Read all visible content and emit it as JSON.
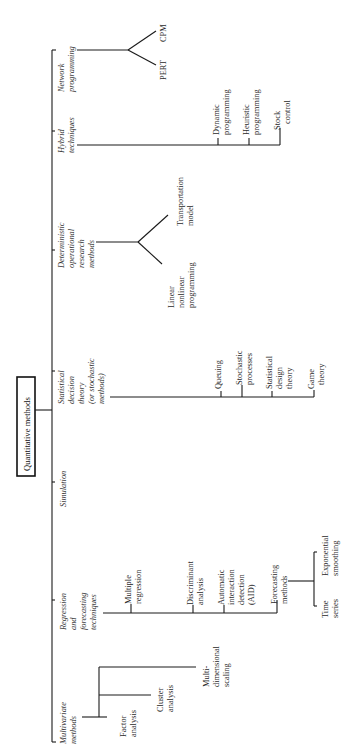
{
  "title": "Quantitative methods",
  "orientation": "rotated 90° counter-clockwise",
  "categories": [
    {
      "label_lines": [
        "Network",
        "programming"
      ],
      "children": [
        {
          "label_lines": [
            "PERT"
          ]
        },
        {
          "label_lines": [
            "CPM"
          ]
        }
      ]
    },
    {
      "label_lines": [
        "Hybrid",
        "techniques"
      ],
      "children": [
        {
          "label_lines": [
            "Dynamic",
            "programming"
          ]
        },
        {
          "label_lines": [
            "Heuristic",
            "programming"
          ]
        },
        {
          "label_lines": [
            "Stock",
            "control"
          ]
        }
      ]
    },
    {
      "label_lines": [
        "Deterministic",
        "operational",
        "research",
        "methods"
      ],
      "children": [
        {
          "label_lines": [
            "Linear",
            "nonlinear",
            "programming"
          ]
        },
        {
          "label_lines": [
            "Transportation",
            "model"
          ]
        }
      ]
    },
    {
      "label_lines": [
        "Statistical",
        "decision",
        "theory",
        "(or stochastic",
        "methods)"
      ],
      "children": [
        {
          "label_lines": [
            "Queuing"
          ]
        },
        {
          "label_lines": [
            "Stochastic",
            "processes"
          ]
        },
        {
          "label_lines": [
            "Statistical",
            "design",
            "theory"
          ]
        },
        {
          "label_lines": [
            "Game",
            "theory"
          ]
        }
      ]
    },
    {
      "label_lines": [
        "Simulation"
      ],
      "children": []
    },
    {
      "label_lines": [
        "Regression",
        "and",
        "forecasting",
        "techniques"
      ],
      "children": [
        {
          "label_lines": [
            "Multiple",
            "regression"
          ]
        },
        {
          "label_lines": [
            "Discriminant",
            "analysis"
          ]
        },
        {
          "label_lines": [
            "Automatic",
            "interaction",
            "detection",
            "(AID)"
          ]
        },
        {
          "label_lines": [
            "Forecasting",
            "methods"
          ],
          "children": [
            {
              "label_lines": [
                "Time",
                "series"
              ]
            },
            {
              "label_lines": [
                "Exponential",
                "smoothing"
              ]
            }
          ]
        }
      ]
    },
    {
      "label_lines": [
        "Multivariate",
        "methods"
      ],
      "children": [
        {
          "label_lines": [
            "Factor",
            "analysis"
          ]
        },
        {
          "label_lines": [
            "Cluster",
            "analysis"
          ]
        },
        {
          "label_lines": [
            "Multi-",
            "dimensional",
            "scaling"
          ]
        }
      ]
    }
  ]
}
